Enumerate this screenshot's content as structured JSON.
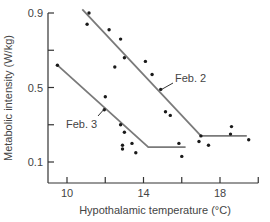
{
  "chart_data": {
    "type": "scatter",
    "title": "",
    "xlabel": "Hypothalamic temperature (°C)",
    "ylabel": "Metabolic intensity (W/kg)",
    "xlim": [
      9,
      20
    ],
    "ylim": [
      0,
      0.9
    ],
    "x_ticks": [
      10,
      12,
      14,
      16,
      18,
      20
    ],
    "x_tick_labels": [
      "10",
      "14",
      "18"
    ],
    "y_ticks": [
      0.1,
      0.3,
      0.5,
      0.7,
      0.9
    ],
    "y_tick_labels": [
      "0.1",
      "0.5",
      "0.9"
    ],
    "grid": false,
    "legend": null,
    "series": [
      {
        "name": "Feb. 2",
        "points": [
          [
            11.15,
            0.9
          ],
          [
            11.05,
            0.84
          ],
          [
            12.2,
            0.81
          ],
          [
            12.8,
            0.76
          ],
          [
            13.0,
            0.66
          ],
          [
            12.5,
            0.61
          ],
          [
            14.1,
            0.64
          ],
          [
            14.45,
            0.57
          ],
          [
            14.9,
            0.49
          ],
          [
            15.15,
            0.37
          ],
          [
            15.4,
            0.35
          ],
          [
            17.0,
            0.24
          ],
          [
            16.9,
            0.21
          ],
          [
            17.4,
            0.19
          ],
          [
            18.6,
            0.29
          ],
          [
            18.55,
            0.25
          ],
          [
            19.5,
            0.22
          ]
        ],
        "fit_line": [
          [
            10.8,
            0.92
          ],
          [
            17.0,
            0.24
          ],
          [
            19.4,
            0.24
          ]
        ]
      },
      {
        "name": "Feb. 3",
        "points": [
          [
            9.5,
            0.62
          ],
          [
            12.0,
            0.45
          ],
          [
            11.95,
            0.38
          ],
          [
            12.8,
            0.3
          ],
          [
            13.0,
            0.26
          ],
          [
            12.9,
            0.19
          ],
          [
            12.9,
            0.17
          ],
          [
            13.4,
            0.2
          ],
          [
            13.6,
            0.15
          ],
          [
            15.85,
            0.2
          ],
          [
            16.0,
            0.13
          ]
        ],
        "fit_line": [
          [
            9.5,
            0.62
          ],
          [
            14.25,
            0.18
          ],
          [
            16.2,
            0.18
          ]
        ]
      }
    ],
    "annotations": [
      {
        "text": "Feb. 2",
        "points_to": [
          14.9,
          0.49
        ]
      },
      {
        "text": "Feb. 3",
        "points_to": [
          12.0,
          0.38
        ]
      }
    ]
  },
  "style": {
    "axis_color": "#333333",
    "line_color": "#7a7a7a",
    "point_color": "#1a1a1a",
    "text_color": "#444444"
  }
}
